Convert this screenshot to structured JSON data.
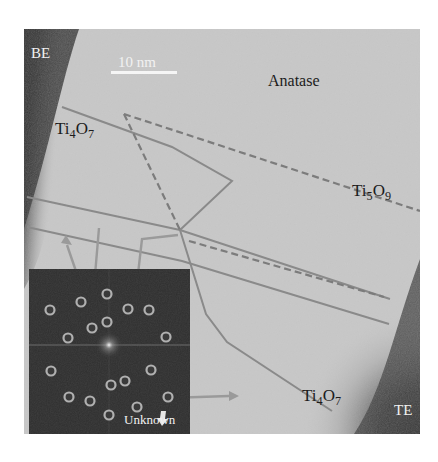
{
  "figure": {
    "type": "TEM micrograph with FFT inset",
    "scale_bar": {
      "label": "10 nm"
    },
    "electrode_labels": {
      "bottom_electrode": "BE",
      "top_electrode": "TE"
    },
    "phase_labels": [
      {
        "id": "anatase",
        "text": "Anatase"
      },
      {
        "id": "ti4o7_top",
        "base": "Ti",
        "sub1": "4",
        "mid": "O",
        "sub2": "7"
      },
      {
        "id": "ti5o9",
        "base": "Ti",
        "sub1": "5",
        "mid": "O",
        "sub2": "9"
      },
      {
        "id": "ti4o7_bottom",
        "base": "Ti",
        "sub1": "4",
        "mid": "O",
        "sub2": "7"
      }
    ],
    "inset": {
      "description": "FFT diffraction pattern with circled spots",
      "annotation": "Unknown"
    },
    "colors": {
      "background": "#c9c9c9",
      "electrode_dark": "#3a3a3a",
      "boundary_lines": "#8a8a8a",
      "inset_bg": "#2e2e2e",
      "spot_ring": "#a8a8a8"
    }
  }
}
